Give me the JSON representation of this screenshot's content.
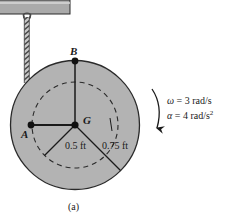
{
  "figure": {
    "caption": "(a)",
    "points": {
      "A": "A",
      "B": "B",
      "G": "G"
    },
    "dimensions": {
      "inner_radius": "0.5 ft",
      "outer_radius": "0.75 ft"
    },
    "kinematics": {
      "omega_symbol": "ω",
      "omega_eq": " = 3 rad/s",
      "alpha_symbol": "α",
      "alpha_eq": " = 4 rad/s",
      "alpha_exp": "2"
    },
    "colors": {
      "disk_fill": "#b3b3b3",
      "ceiling_fill": "#aaaaaa",
      "outline": "#1a1a1a",
      "background": "#ffffff"
    }
  },
  "geometry": {
    "disk_center_x": 75,
    "disk_center_y": 125,
    "outer_radius_px": 65,
    "inner_radius_px": 43,
    "cable_x": 27,
    "ceiling_y": 14
  }
}
